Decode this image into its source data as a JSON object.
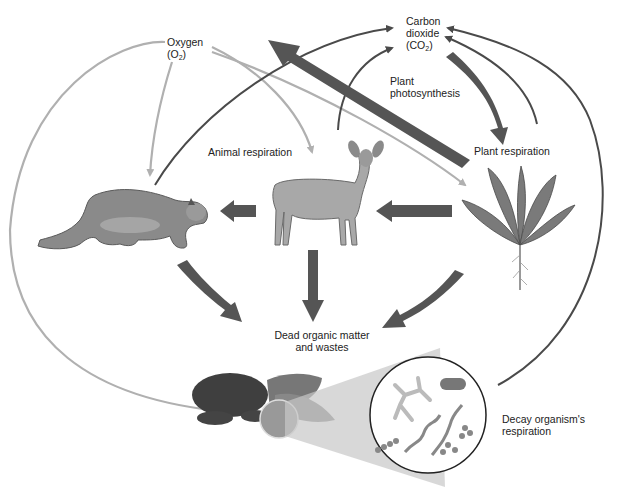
{
  "labels": {
    "oxygen": "Oxygen",
    "oxygen_formula_main": "(O",
    "oxygen_formula_sub": "2",
    "oxygen_formula_end": ")",
    "co2_line1": "Carbon",
    "co2_line2": "dioxide",
    "co2_formula_main": "(CO",
    "co2_formula_sub": "2",
    "co2_formula_end": ")",
    "plant_photosynthesis_1": "Plant",
    "plant_photosynthesis_2": "photosynthesis",
    "animal_respiration": "Animal respiration",
    "plant_respiration": "Plant respiration",
    "dead_matter_1": "Dead organic matter",
    "dead_matter_2": "and wastes",
    "decay_1": "Decay organism's",
    "decay_2": "respiration"
  },
  "organisms": [
    "cougar",
    "deer",
    "plant",
    "decomposers"
  ],
  "colors": {
    "dark_arrow": "#555555",
    "light_arrow": "#b0b0b0",
    "thin_dark_arrow": "#4a4a4a"
  }
}
